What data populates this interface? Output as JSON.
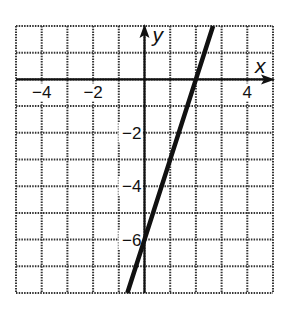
{
  "chart_data": {
    "type": "line",
    "title": "",
    "xlabel": "x",
    "ylabel": "y",
    "xlim": [
      -5,
      5
    ],
    "ylim": [
      -8,
      2
    ],
    "grid": true,
    "grid_style": "dotted",
    "x_tick_labels": [
      {
        "value": -4,
        "label": "−4"
      },
      {
        "value": -2,
        "label": "−2"
      },
      {
        "value": 4,
        "label": "4"
      }
    ],
    "y_tick_labels": [
      {
        "value": -2,
        "label": "−2"
      },
      {
        "value": -4,
        "label": "−4"
      },
      {
        "value": -6,
        "label": "−6"
      }
    ],
    "series": [
      {
        "name": "y = 3x − 6",
        "equation": "y = 3x - 6",
        "slope": 3,
        "y_intercept": -6,
        "x_intercept": 2,
        "x": [
          -0.667,
          0,
          2,
          2.667
        ],
        "y": [
          -8,
          -6,
          0,
          2
        ],
        "color": "#111111"
      }
    ],
    "legend": null
  },
  "colors": {
    "grid": "#333333",
    "axis": "#111111",
    "line": "#111111",
    "background": "#ffffff"
  }
}
